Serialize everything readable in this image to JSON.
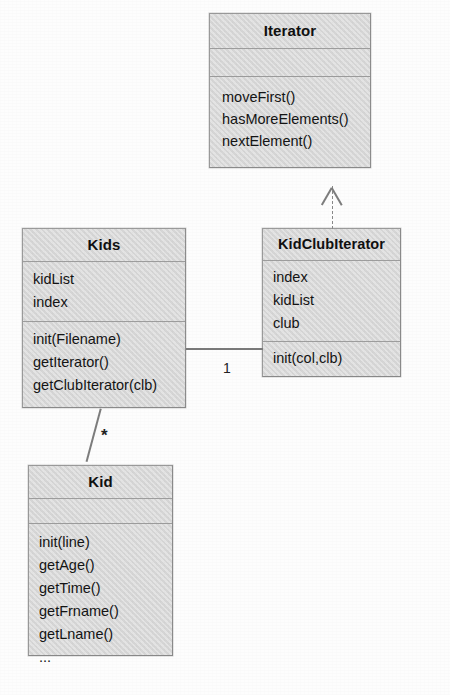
{
  "diagram": {
    "kind": "uml-class-diagram",
    "colors": {
      "box_fill": "#d8d8d8",
      "box_border": "#9a9a9a",
      "edge": "#7a7a7a",
      "text": "#141414",
      "page_background": "#fdfdfd"
    },
    "classes": [
      {
        "id": "iterator",
        "name": "Iterator",
        "attributes": [],
        "operations": [
          "moveFirst()",
          "hasMoreElements()",
          "nextElement()"
        ]
      },
      {
        "id": "kids",
        "name": "Kids",
        "attributes": [
          "kidList",
          "index"
        ],
        "operations": [
          "init(Filename)",
          "getIterator()",
          "getClubIterator(clb)"
        ]
      },
      {
        "id": "kidclubiterator",
        "name": "KidClubIterator",
        "attributes": [
          "index",
          "kidList",
          "club"
        ],
        "operations": [
          "init(col,clb)"
        ]
      },
      {
        "id": "kid",
        "name": "Kid",
        "attributes": [],
        "operations": [
          "init(line)",
          "getAge()",
          "getTime()",
          "getFrname()",
          "getLname()",
          "..."
        ]
      }
    ],
    "relationships": [
      {
        "id": "realization",
        "type": "realization",
        "from": "kidclubiterator",
        "to": "iterator",
        "style": "dashed",
        "arrowhead": "hollow-triangle",
        "label": ""
      },
      {
        "id": "kids-kidclubiterator",
        "type": "association",
        "from": "kids",
        "to": "kidclubiterator",
        "style": "solid",
        "arrowhead": "none",
        "label": "1"
      },
      {
        "id": "kids-kid",
        "type": "association",
        "from": "kids",
        "to": "kid",
        "style": "solid",
        "arrowhead": "none",
        "label": "*"
      }
    ]
  }
}
